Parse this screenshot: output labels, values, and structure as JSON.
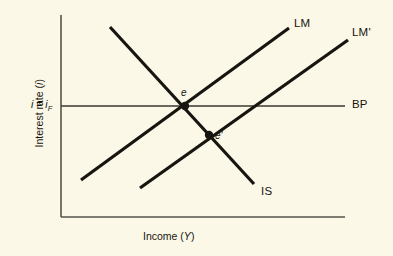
{
  "figure": {
    "background_color": "#fbf8e8",
    "ink_color": "#16150f",
    "axis_color": "#55544a"
  },
  "axes": {
    "y_title": "Interest rate (i)",
    "y_title_plain": "Interest rate",
    "y_title_symbol": "i",
    "x_title_plain": "Income",
    "x_title_symbol": "Y",
    "y_level_label": "i = i_F",
    "y_level_symbol": "i",
    "y_level_eq": " = ",
    "y_level_symbol2": "i",
    "y_level_sub": "F",
    "origin": [
      61,
      217
    ],
    "y_axis_top": [
      61,
      15
    ],
    "x_axis_right": [
      345,
      217
    ]
  },
  "chart_data": {
    "type": "line",
    "title": "",
    "xlabel": "Income (Y)",
    "ylabel": "Interest rate (i)",
    "grid": false,
    "legend": "inline-end-labels",
    "curves": [
      {
        "name": "IS",
        "label": "IS",
        "slope": "negative",
        "start": [
          110,
          27
        ],
        "end": [
          254,
          184
        ],
        "stroke_width": 3.2
      },
      {
        "name": "LM",
        "label": "LM",
        "slope": "positive",
        "start": [
          81,
          180
        ],
        "end": [
          289,
          28
        ],
        "stroke_width": 3.2
      },
      {
        "name": "LM'",
        "label": "LM'",
        "slope": "positive",
        "start": [
          140,
          188
        ],
        "end": [
          348,
          40
        ],
        "stroke_width": 3.2
      },
      {
        "name": "BP",
        "label": "BP",
        "slope": "horizontal",
        "start": [
          61,
          106
        ],
        "end": [
          345,
          106
        ],
        "stroke_width": 1.3
      }
    ],
    "points": [
      {
        "name": "e",
        "label": "e",
        "x": 185,
        "y": 106,
        "marker": "filled-dot",
        "intersection_of": [
          "IS",
          "LM",
          "BP"
        ]
      },
      {
        "name": "e'",
        "label": "e'",
        "x": 209,
        "y": 135,
        "marker": "filled-dot",
        "intersection_of": [
          "IS",
          "LM'"
        ]
      }
    ]
  }
}
